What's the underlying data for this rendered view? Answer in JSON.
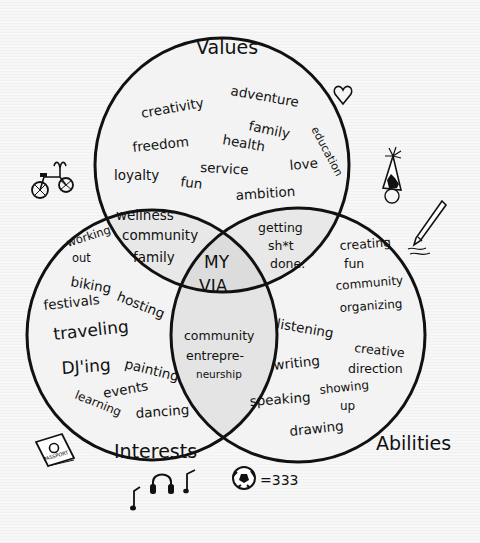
{
  "diagram": {
    "type": "venn",
    "center_label": [
      "MY",
      "VIA"
    ],
    "sets": [
      {
        "name": "Values",
        "label": "Values"
      },
      {
        "name": "Interests",
        "label": "Interests"
      },
      {
        "name": "Abilities",
        "label": "Abilities"
      }
    ],
    "regions": {
      "values_only": [
        "creativity",
        "adventure",
        "family",
        "education",
        "freedom",
        "health",
        "service",
        "love",
        "loyalty",
        "fun",
        "ambition"
      ],
      "values_interests": [
        "wellness",
        "community",
        "family"
      ],
      "values_abilities": [
        "getting",
        "sh*t",
        "done."
      ],
      "interests_only": [
        "working",
        "out",
        "biking",
        "festivals",
        "hosting",
        "traveling",
        "DJ'ing",
        "painting",
        "events",
        "learning",
        "dancing"
      ],
      "interests_abilities": [
        "community",
        "entrepre-",
        "neurship"
      ],
      "abilities_only": [
        "creating",
        "fun",
        "community",
        "organizing",
        "listening",
        "creative",
        "direction",
        "writing",
        "speaking",
        "showing",
        "up",
        "drawing"
      ]
    },
    "doodles": {
      "heart": "heart-icon",
      "bicycle": "bicycle-icon",
      "party_hat": "party-hat-icon",
      "pencil": "pencil-icon",
      "passport": "passport-icon",
      "passport_text": "PASSPORT",
      "headphones": "headphones-icon",
      "music_notes": "music-note-icon",
      "soccer_ball": "soccer-ball-icon",
      "soccer_text": "=333"
    }
  }
}
